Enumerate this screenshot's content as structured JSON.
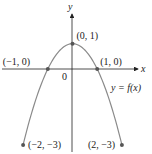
{
  "chart_data": {
    "type": "line",
    "title": "",
    "xlabel": "x",
    "ylabel": "y",
    "curve_label": "y = f(x)",
    "function": "f(x) = 1 - x^2",
    "x": [
      -2,
      -1.5,
      -1,
      -0.5,
      0,
      0.5,
      1,
      1.5,
      2
    ],
    "y": [
      -3,
      -1.25,
      0,
      0.75,
      1,
      0.75,
      0,
      -1.25,
      -3
    ],
    "xlim": [
      -2,
      2
    ],
    "ylim": [
      -3,
      1
    ],
    "grid": false,
    "origin_label": "0",
    "marked_points": [
      {
        "x": -1,
        "y": 0,
        "label": "(−1, 0)"
      },
      {
        "x": 0,
        "y": 1,
        "label": "(0, 1)"
      },
      {
        "x": 1,
        "y": 0,
        "label": "(1, 0)"
      },
      {
        "x": -2,
        "y": -3,
        "label": "(−2, −3)"
      },
      {
        "x": 2,
        "y": -3,
        "label": "(2, −3)"
      }
    ],
    "colors": {
      "curve": "#8a8a8a",
      "axes": "#222222",
      "points": "#555555"
    }
  }
}
